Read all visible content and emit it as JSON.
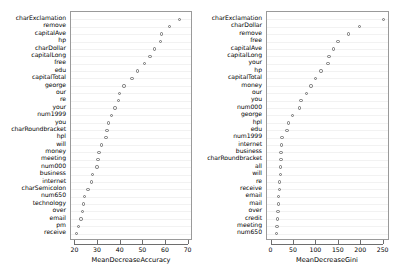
{
  "chart_data": [
    {
      "type": "scatter",
      "title": "",
      "xlabel": "MeanDecreaseAccuracy",
      "ylabel": "",
      "xlim": [
        18.5,
        71.5
      ],
      "xticks": [
        20,
        30,
        40,
        50,
        60,
        70
      ],
      "grid": true,
      "legend": "none",
      "panel": "left",
      "categories": [
        "charExclamation",
        "remove",
        "capitalAve",
        "hp",
        "charDollar",
        "capitalLong",
        "free",
        "edu",
        "capitalTotal",
        "george",
        "our",
        "re",
        "your",
        "num1999",
        "you",
        "charRoundbracket",
        "hpl",
        "will",
        "money",
        "meeting",
        "num000",
        "business",
        "internet",
        "charSemicolon",
        "num650",
        "technology",
        "over",
        "email",
        "pm",
        "receive"
      ],
      "values": [
        66.0,
        61.5,
        58.0,
        57.5,
        55.0,
        53.0,
        50.5,
        47.5,
        45.0,
        41.5,
        39.5,
        39.0,
        37.5,
        36.0,
        34.5,
        34.0,
        33.5,
        31.5,
        30.5,
        30.0,
        29.5,
        27.5,
        27.0,
        25.5,
        24.0,
        23.5,
        23.0,
        22.5,
        21.5,
        20.5
      ]
    },
    {
      "type": "scatter",
      "title": "",
      "xlabel": "MeanDecreaseGini",
      "ylabel": "",
      "xlim": [
        -8,
        262
      ],
      "xticks": [
        0,
        50,
        100,
        150,
        200,
        250
      ],
      "grid": true,
      "legend": "none",
      "panel": "right",
      "categories": [
        "charExclamation",
        "charDollar",
        "remove",
        "free",
        "capitalAve",
        "capitalLong",
        "your",
        "hp",
        "capitalTotal",
        "money",
        "our",
        "you",
        "num000",
        "george",
        "hpl",
        "edu",
        "num1999",
        "internet",
        "business",
        "charRoundbracket",
        "all",
        "will",
        "re",
        "receive",
        "email",
        "mail",
        "over",
        "credit",
        "meeting",
        "num650"
      ],
      "values": [
        250.0,
        196.0,
        172.0,
        148.0,
        138.0,
        128.0,
        126.0,
        110.0,
        98.0,
        88.0,
        78.0,
        66.0,
        62.0,
        46.0,
        38.0,
        34.0,
        23.0,
        22.0,
        21.0,
        21.0,
        20.0,
        20.0,
        18.0,
        17.0,
        16.0,
        15.0,
        14.0,
        13.0,
        12.0,
        11.0
      ]
    }
  ]
}
